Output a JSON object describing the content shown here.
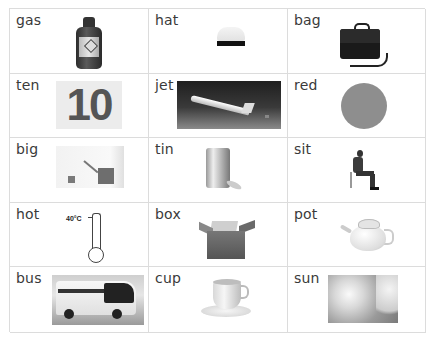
{
  "worksheet": {
    "cells": [
      {
        "word": "gas",
        "picture": "gas-cylinder"
      },
      {
        "word": "hat",
        "picture": "hat"
      },
      {
        "word": "bag",
        "picture": "bag"
      },
      {
        "word": "ten",
        "picture": "number-ten",
        "picture_text": "10"
      },
      {
        "word": "jet",
        "picture": "jet-plane"
      },
      {
        "word": "red",
        "picture": "red-circle",
        "picture_color": "#8e8e8e"
      },
      {
        "word": "big",
        "picture": "big-and-small-squares"
      },
      {
        "word": "tin",
        "picture": "tin-can"
      },
      {
        "word": "sit",
        "picture": "seated-man"
      },
      {
        "word": "hot",
        "picture": "thermometer",
        "picture_text": "40°C"
      },
      {
        "word": "box",
        "picture": "cardboard-box"
      },
      {
        "word": "pot",
        "picture": "teapot"
      },
      {
        "word": "bus",
        "picture": "coach-bus"
      },
      {
        "word": "cup",
        "picture": "cup-and-saucer"
      },
      {
        "word": "sun",
        "picture": "sun-in-sky"
      }
    ]
  },
  "colors": {
    "grid_line": "#dcdcdc",
    "text": "#3a3a3a"
  }
}
